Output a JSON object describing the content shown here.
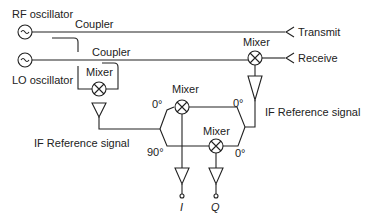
{
  "diagram": {
    "labels": {
      "rf_oscillator": "RF oscillator",
      "lo_oscillator": "LO oscillator",
      "coupler_top": "Coupler",
      "coupler_bottom": "Coupler",
      "transmit": "Transmit",
      "receive": "Receive",
      "mixer_receive": "Mixer",
      "mixer_lo": "Mixer",
      "mixer_i": "Mixer",
      "mixer_q": "Mixer",
      "if_ref_left": "IF Reference signal",
      "if_ref_right": "IF Reference signal",
      "phase_0_left": "0°",
      "phase_90_left": "90°",
      "phase_0_right_top": "0°",
      "phase_0_right_bottom": "0°",
      "output_i": "I",
      "output_q": "Q"
    },
    "colors": {
      "stroke": "#222222",
      "background": "#ffffff"
    }
  }
}
